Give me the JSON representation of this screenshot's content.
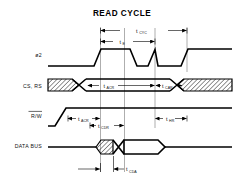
{
  "figure": {
    "title": "READ CYCLE",
    "kind": "timing-diagram"
  },
  "signals": [
    {
      "id": "phi2",
      "label": "ø2",
      "overbar": false
    },
    {
      "id": "cs-rs",
      "label": "CS, RS",
      "overbar": false
    },
    {
      "id": "r-w",
      "label": "R/W",
      "overbar": true
    },
    {
      "id": "data-bus",
      "label": "DATA BUS",
      "overbar": false
    }
  ],
  "timing_labels": {
    "t_cyc": {
      "base": "t",
      "sub": "CYC"
    },
    "t_e": {
      "base": "t",
      "sub": "E"
    },
    "t_acr": {
      "base": "t",
      "sub": "ACR"
    },
    "t_car": {
      "base": "t",
      "sub": "CAR"
    },
    "t_acr2": {
      "base": "t",
      "sub": "ACR"
    },
    "t_cdr": {
      "base": "t",
      "sub": "CDR"
    },
    "t_hr": {
      "base": "t",
      "sub": "HR"
    },
    "t_cda": {
      "base": "t",
      "sub": "CDA"
    }
  },
  "colors": {
    "ink": "#000000",
    "background": "#ffffff",
    "guide": "#4a4a4a",
    "hatch": "#333333"
  }
}
